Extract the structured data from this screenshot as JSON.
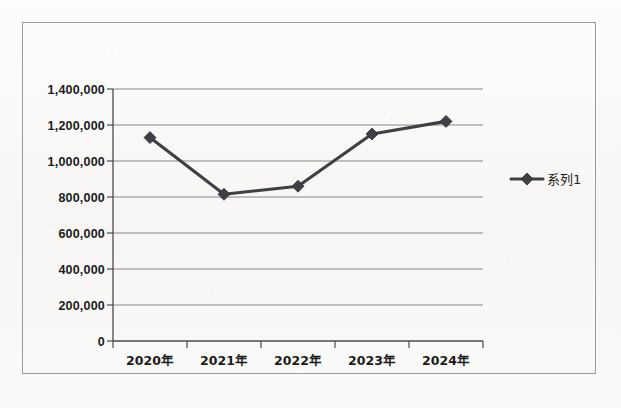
{
  "chart_data": {
    "type": "line",
    "title": "",
    "subtitle": "",
    "xlabel": "",
    "ylabel": "",
    "categories": [
      "2020年",
      "2021年",
      "2022年",
      "2023年",
      "2024年"
    ],
    "series": [
      {
        "name": "系列1",
        "values": [
          1130000,
          815000,
          860000,
          1150000,
          1220000
        ],
        "marker": "diamond",
        "color": "#3f3f46"
      }
    ],
    "ylim": [
      0,
      1400000
    ],
    "ytick_labels": [
      "0",
      "200,000",
      "400,000",
      "600,000",
      "800,000",
      "1,000,000",
      "1,200,000",
      "1,400,000"
    ],
    "ytick_values": [
      0,
      200000,
      400000,
      600000,
      800000,
      1000000,
      1200000,
      1400000
    ],
    "grid": true,
    "grid_axis": "y",
    "legend_position": "right",
    "legend_entries": [
      "系列1"
    ],
    "plot_background": "#ffffff",
    "grid_color": "#868686",
    "axis_color": "#4a4a4a",
    "border_color": "#9a9a9a"
  },
  "frame": {
    "border_label": "chart-outer-border"
  }
}
